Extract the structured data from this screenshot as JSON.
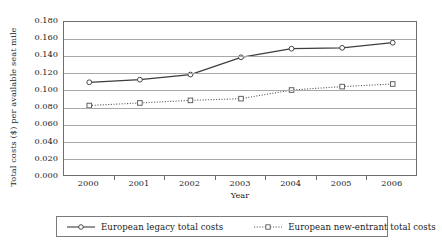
{
  "chart_data": {
    "type": "line",
    "title": "",
    "xlabel": "Year",
    "ylabel": "Total costs ($) per available seat mile",
    "categories": [
      "2000",
      "2001",
      "2002",
      "2003",
      "2004",
      "2005",
      "2006"
    ],
    "ylim": [
      0.0,
      0.18
    ],
    "ytick_step": 0.02,
    "ytick_labels": [
      "0.180",
      "0.160",
      "0.140",
      "0.120",
      "0.100",
      "0.080",
      "0.060",
      "0.040",
      "0.020",
      "0.000"
    ],
    "ytick_values": [
      0.18,
      0.16,
      0.14,
      0.12,
      0.1,
      0.08,
      0.06,
      0.04,
      0.02,
      0.0
    ],
    "grid": true,
    "legend_position": "bottom",
    "series": [
      {
        "name": "European legacy total costs",
        "marker": "open-circle",
        "line_style": "solid",
        "color": "#3d3d3d",
        "values": [
          0.11,
          0.113,
          0.119,
          0.139,
          0.149,
          0.15,
          0.156
        ]
      },
      {
        "name": "European new-entrant total costs",
        "marker": "open-square",
        "line_style": "dotted",
        "color": "#5a5a5a",
        "values": [
          0.083,
          0.086,
          0.089,
          0.091,
          0.101,
          0.105,
          0.108
        ]
      }
    ]
  },
  "legend": {
    "entries": [
      {
        "label": "European legacy total costs"
      },
      {
        "label": "European new-entrant total costs"
      }
    ]
  },
  "colors": {
    "legacy_line": "#3d3d3d",
    "newentrant_line": "#5a5a5a",
    "gridline": "#a8a8a8",
    "frame": "#6e6e6e",
    "text": "#1a1a1a"
  }
}
